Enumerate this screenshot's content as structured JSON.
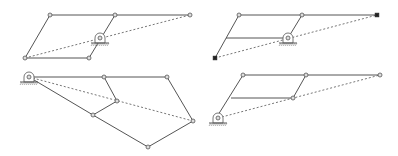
{
  "diagram": {
    "title": "",
    "colors": {
      "link": "#555555",
      "dashed": "#777777",
      "joint": "#dddddd",
      "filled_joint": "#222222"
    },
    "panels": [
      {
        "id": "panel-1",
        "links": [
          [
            50,
            15,
            115,
            15
          ],
          [
            115,
            15,
            190,
            15
          ],
          [
            50,
            15,
            25,
            58
          ],
          [
            25,
            58,
            89,
            58
          ],
          [
            115,
            15,
            89,
            58
          ]
        ],
        "dashed": [
          [
            25,
            58,
            190,
            15
          ]
        ],
        "joints": [
          [
            50,
            15
          ],
          [
            115,
            15
          ],
          [
            190,
            15
          ],
          [
            25,
            58
          ],
          [
            89,
            58
          ]
        ],
        "filled_joints": [],
        "pivot": [
          100,
          38
        ]
      },
      {
        "id": "panel-2",
        "links": [
          [
            239,
            15,
            302,
            15
          ],
          [
            302,
            15,
            377,
            15
          ],
          [
            239,
            15,
            215,
            58
          ],
          [
            226,
            38,
            288,
            38
          ],
          [
            302,
            15,
            288,
            38
          ]
        ],
        "dashed": [
          [
            215,
            58,
            377,
            15
          ]
        ],
        "joints": [
          [
            239,
            15
          ],
          [
            302,
            15
          ]
        ],
        "filled_joints": [
          [
            377,
            15
          ],
          [
            215,
            58
          ]
        ],
        "pivot": [
          288,
          38
        ]
      },
      {
        "id": "panel-3",
        "links": [
          [
            29,
            77,
            104,
            77
          ],
          [
            104,
            77,
            167,
            77
          ],
          [
            104,
            77,
            117,
            101
          ],
          [
            117,
            101,
            93,
            115
          ],
          [
            29,
            77,
            93,
            115
          ],
          [
            93,
            115,
            148,
            147
          ],
          [
            148,
            147,
            193,
            121
          ],
          [
            167,
            77,
            193,
            121
          ]
        ],
        "dashed": [
          [
            29,
            77,
            193,
            121
          ]
        ],
        "joints": [
          [
            104,
            77
          ],
          [
            167,
            77
          ],
          [
            117,
            101
          ],
          [
            93,
            115
          ],
          [
            148,
            147
          ],
          [
            193,
            121
          ]
        ],
        "filled_joints": [],
        "pivot": [
          29,
          77
        ]
      },
      {
        "id": "panel-4",
        "links": [
          [
            218,
            115,
            243,
            75
          ],
          [
            243,
            75,
            306,
            75
          ],
          [
            306,
            75,
            380,
            75
          ],
          [
            231,
            98,
            293,
            98
          ],
          [
            306,
            75,
            293,
            98
          ]
        ],
        "dashed": [
          [
            218,
            118,
            380,
            75
          ]
        ],
        "joints": [
          [
            243,
            75
          ],
          [
            306,
            75
          ],
          [
            380,
            75
          ],
          [
            293,
            98
          ]
        ],
        "filled_joints": [],
        "pivot": [
          218,
          118
        ]
      }
    ]
  }
}
